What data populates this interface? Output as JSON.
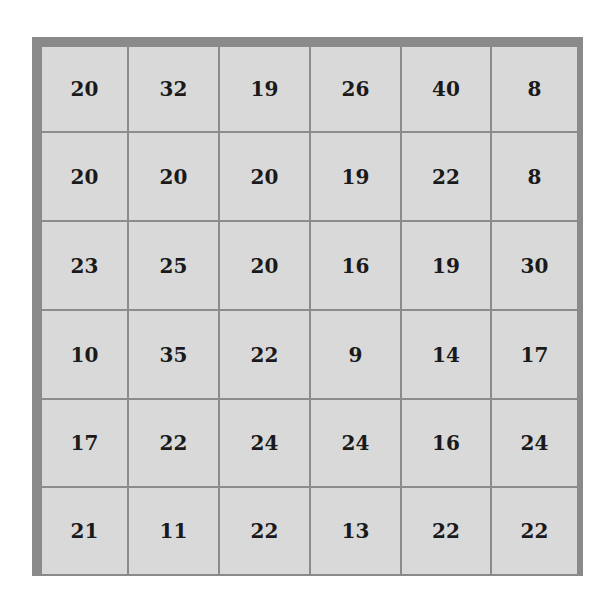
{
  "grid": {
    "rows": 6,
    "cols": 6,
    "colors": {
      "border": "#8a8a8a",
      "cell": "#d9d9d9",
      "text": "#1a1a1a"
    },
    "cells": [
      [
        "20",
        "32",
        "19",
        "26",
        "40",
        "8"
      ],
      [
        "20",
        "20",
        "20",
        "19",
        "22",
        "8"
      ],
      [
        "23",
        "25",
        "20",
        "16",
        "19",
        "30"
      ],
      [
        "10",
        "35",
        "22",
        "9",
        "14",
        "17"
      ],
      [
        "17",
        "22",
        "24",
        "24",
        "16",
        "24"
      ],
      [
        "21",
        "11",
        "22",
        "13",
        "22",
        "22"
      ]
    ]
  }
}
